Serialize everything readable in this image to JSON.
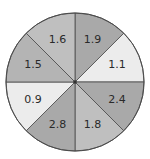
{
  "chart_data": {
    "type": "pie",
    "title": "",
    "categories": [
      "sector-1",
      "sector-2",
      "sector-3",
      "sector-4",
      "sector-5",
      "sector-6",
      "sector-7",
      "sector-8"
    ],
    "labels": [
      "1.9",
      "1.1",
      "2.4",
      "1.8",
      "2.8",
      "0.9",
      "1.5",
      "1.6"
    ],
    "values": [
      1.9,
      1.1,
      2.4,
      1.8,
      2.8,
      0.9,
      1.5,
      1.6
    ],
    "slice_sizes": [
      1,
      1,
      1,
      1,
      1,
      1,
      1,
      1
    ],
    "start_angle_deg": 0,
    "direction": "clockwise"
  },
  "wheel": {
    "center": [
      75,
      82
    ],
    "radius": 69,
    "sectors": [
      {
        "label": "1.9",
        "fill": "#a9a9a9"
      },
      {
        "label": "1.1",
        "fill": "#ececec"
      },
      {
        "label": "2.4",
        "fill": "#a9a9a9"
      },
      {
        "label": "1.8",
        "fill": "#bfbfbf"
      },
      {
        "label": "2.8",
        "fill": "#a9a9a9"
      },
      {
        "label": "0.9",
        "fill": "#ececec"
      },
      {
        "label": "1.5",
        "fill": "#b4b4b4"
      },
      {
        "label": "1.6",
        "fill": "#bfbfbf"
      }
    ]
  }
}
